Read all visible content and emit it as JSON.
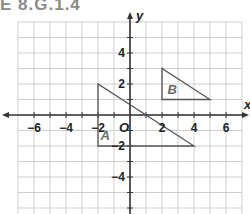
{
  "header": {
    "title": "E 8.G.1.4"
  },
  "plane": {
    "x_axis_label": "x",
    "y_axis_label": "y",
    "origin_label": "O",
    "x_ticks": [
      {
        "value": -6,
        "label": "−6"
      },
      {
        "value": -4,
        "label": "−4"
      },
      {
        "value": -2,
        "label": "−2"
      },
      {
        "value": 2,
        "label": "2"
      },
      {
        "value": 4,
        "label": "4"
      },
      {
        "value": 6,
        "label": "6"
      }
    ],
    "y_ticks": [
      {
        "value": 4,
        "label": "4"
      },
      {
        "value": 2,
        "label": "2"
      },
      {
        "value": -2,
        "label": "−2"
      },
      {
        "value": -4,
        "label": "−4"
      }
    ],
    "x_range": [
      -7,
      7
    ],
    "y_range": [
      -6.3,
      6
    ]
  },
  "figures": {
    "A": {
      "label": "A",
      "vertices": [
        [
          -2,
          2
        ],
        [
          -2,
          -2
        ],
        [
          4,
          -2
        ]
      ]
    },
    "B": {
      "label": "B",
      "vertices": [
        [
          2,
          3
        ],
        [
          2,
          1
        ],
        [
          5,
          1
        ]
      ]
    }
  },
  "colors": {
    "grid": "#cfcfcf",
    "axis": "#333333",
    "triangle": "#555555",
    "title": "#8a8a8a"
  }
}
